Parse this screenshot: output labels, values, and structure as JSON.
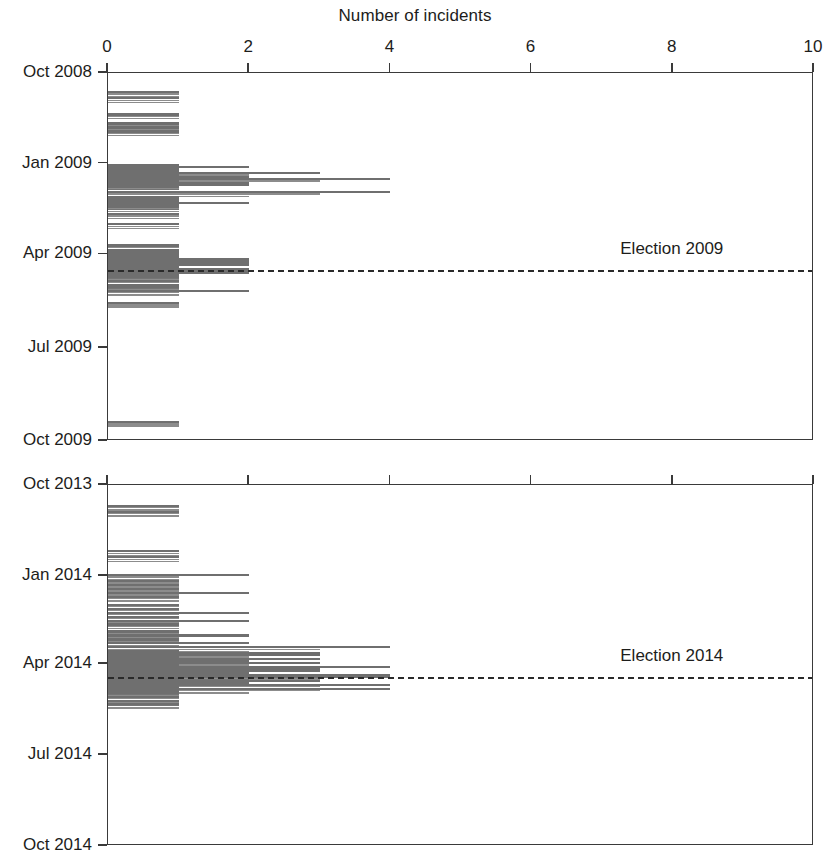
{
  "figure": {
    "axis_title": "Number of incidents",
    "background": "#ffffff",
    "bar_color": "#6f6f6f",
    "axis_color": "#3a3a3a",
    "text_color": "#1d1d1b"
  },
  "panels": [
    {
      "id": "panel-2008-2009",
      "name": "top-panel",
      "election_label": "Election 2009",
      "y_labels": [
        "Oct 2008",
        "Jan 2009",
        "Apr 2009",
        "Jul 2009",
        "Oct 2009"
      ],
      "x_labels": [
        "0",
        "2",
        "4",
        "6",
        "8",
        "10"
      ],
      "show_x_labels": true
    },
    {
      "id": "panel-2013-2014",
      "name": "bottom-panel",
      "election_label": "Election 2014",
      "y_labels": [
        "Oct 2013",
        "Jan 2014",
        "Apr 2014",
        "Jul 2014",
        "Oct 2014"
      ],
      "x_labels": [
        "0",
        "2",
        "4",
        "6",
        "8",
        "10"
      ],
      "show_x_labels": false
    }
  ],
  "chart_data": {
    "type": "bar",
    "orientation": "horizontal",
    "title": "",
    "xlabel": "Number of incidents",
    "ylabel": "",
    "xlim": [
      0,
      10
    ],
    "xticks": [
      0,
      2,
      4,
      6,
      8,
      10
    ],
    "grid": false,
    "legend": null,
    "panels": [
      {
        "name": "Election 2009 cycle",
        "ylim": [
          "Oct 2008",
          "Oct 2009"
        ],
        "yticks": [
          "Oct 2008",
          "Jan 2009",
          "Apr 2009",
          "Jul 2009",
          "Oct 2009"
        ],
        "ytick_fractions": [
          0.0,
          0.2466,
          0.4932,
          0.7479,
          1.0
        ],
        "election_marker": {
          "label": "Election 2009",
          "fraction": 0.5342,
          "label_x_value": 8.0
        },
        "series": [
          {
            "name": "incidents per day",
            "points": [
              {
                "t": 0.0493,
                "v": 1
              },
              {
                "t": 0.0658,
                "v": 1
              },
              {
                "t": 0.1096,
                "v": 1
              },
              {
                "t": 0.1342,
                "v": 1
              },
              {
                "t": 0.1452,
                "v": 1
              },
              {
                "t": 0.1562,
                "v": 1
              },
              {
                "t": 0.2466,
                "v": 1
              },
              {
                "t": 0.2521,
                "v": 2
              },
              {
                "t": 0.2575,
                "v": 1
              },
              {
                "t": 0.263,
                "v": 1
              },
              {
                "t": 0.2685,
                "v": 3
              },
              {
                "t": 0.274,
                "v": 1
              },
              {
                "t": 0.2795,
                "v": 2
              },
              {
                "t": 0.2849,
                "v": 4
              },
              {
                "t": 0.2904,
                "v": 1
              },
              {
                "t": 0.2959,
                "v": 2
              },
              {
                "t": 0.3014,
                "v": 2
              },
              {
                "t": 0.3068,
                "v": 1
              },
              {
                "t": 0.3205,
                "v": 4
              },
              {
                "t": 0.3342,
                "v": 1
              },
              {
                "t": 0.3397,
                "v": 1
              },
              {
                "t": 0.3452,
                "v": 1
              },
              {
                "t": 0.3507,
                "v": 2
              },
              {
                "t": 0.3562,
                "v": 1
              },
              {
                "t": 0.3616,
                "v": 1
              },
              {
                "t": 0.3808,
                "v": 1
              },
              {
                "t": 0.4082,
                "v": 1
              },
              {
                "t": 0.4658,
                "v": 1
              },
              {
                "t": 0.4795,
                "v": 1
              },
              {
                "t": 0.4849,
                "v": 1
              },
              {
                "t": 0.4904,
                "v": 1
              },
              {
                "t": 0.4959,
                "v": 1
              },
              {
                "t": 0.5014,
                "v": 2
              },
              {
                "t": 0.5068,
                "v": 2
              },
              {
                "t": 0.5123,
                "v": 2
              },
              {
                "t": 0.5178,
                "v": 2
              },
              {
                "t": 0.5233,
                "v": 1
              },
              {
                "t": 0.5288,
                "v": 2
              },
              {
                "t": 0.5342,
                "v": 2
              },
              {
                "t": 0.5397,
                "v": 2
              },
              {
                "t": 0.5452,
                "v": 1
              },
              {
                "t": 0.5507,
                "v": 1
              },
              {
                "t": 0.5616,
                "v": 1
              },
              {
                "t": 0.5726,
                "v": 1
              },
              {
                "t": 0.5781,
                "v": 1
              },
              {
                "t": 0.589,
                "v": 2
              },
              {
                "t": 0.6219,
                "v": 1
              },
              {
                "t": 0.9452,
                "v": 1
              }
            ]
          }
        ]
      },
      {
        "name": "Election 2014 cycle",
        "ylim": [
          "Oct 2013",
          "Oct 2014"
        ],
        "yticks": [
          "Oct 2013",
          "Jan 2014",
          "Apr 2014",
          "Jul 2014",
          "Oct 2014"
        ],
        "ytick_fractions": [
          0.0,
          0.2521,
          0.4959,
          0.7479,
          1.0
        ],
        "election_marker": {
          "label": "Election 2014",
          "fraction": 0.5315,
          "label_x_value": 8.0
        },
        "series": [
          {
            "name": "incidents per day",
            "points": [
              {
                "t": 0.0548,
                "v": 1
              },
              {
                "t": 0.0712,
                "v": 1
              },
              {
                "t": 0.1808,
                "v": 1
              },
              {
                "t": 0.1973,
                "v": 1
              },
              {
                "t": 0.2466,
                "v": 2
              },
              {
                "t": 0.263,
                "v": 1
              },
              {
                "t": 0.274,
                "v": 1
              },
              {
                "t": 0.2849,
                "v": 1
              },
              {
                "t": 0.2959,
                "v": 2
              },
              {
                "t": 0.3068,
                "v": 1
              },
              {
                "t": 0.3288,
                "v": 1
              },
              {
                "t": 0.3397,
                "v": 1
              },
              {
                "t": 0.3507,
                "v": 2
              },
              {
                "t": 0.3616,
                "v": 1
              },
              {
                "t": 0.3726,
                "v": 2
              },
              {
                "t": 0.3836,
                "v": 1
              },
              {
                "t": 0.4027,
                "v": 1
              },
              {
                "t": 0.4137,
                "v": 2
              },
              {
                "t": 0.4247,
                "v": 1
              },
              {
                "t": 0.4356,
                "v": 2
              },
              {
                "t": 0.4466,
                "v": 4
              },
              {
                "t": 0.4575,
                "v": 1
              },
              {
                "t": 0.463,
                "v": 3
              },
              {
                "t": 0.4685,
                "v": 3
              },
              {
                "t": 0.474,
                "v": 1
              },
              {
                "t": 0.4795,
                "v": 3
              },
              {
                "t": 0.4849,
                "v": 2
              },
              {
                "t": 0.4904,
                "v": 3
              },
              {
                "t": 0.4959,
                "v": 1
              },
              {
                "t": 0.5014,
                "v": 4
              },
              {
                "t": 0.5068,
                "v": 3
              },
              {
                "t": 0.5123,
                "v": 3
              },
              {
                "t": 0.5178,
                "v": 2
              },
              {
                "t": 0.5233,
                "v": 4
              },
              {
                "t": 0.5288,
                "v": 4
              },
              {
                "t": 0.5342,
                "v": 1
              },
              {
                "t": 0.5397,
                "v": 3
              },
              {
                "t": 0.5452,
                "v": 2
              },
              {
                "t": 0.5507,
                "v": 4
              },
              {
                "t": 0.5562,
                "v": 1
              },
              {
                "t": 0.5616,
                "v": 4
              },
              {
                "t": 0.5671,
                "v": 1
              },
              {
                "t": 0.5726,
                "v": 1
              },
              {
                "t": 0.5836,
                "v": 1
              },
              {
                "t": 0.5945,
                "v": 1
              },
              {
                "t": 0.6027,
                "v": 1
              }
            ]
          }
        ]
      }
    ]
  }
}
